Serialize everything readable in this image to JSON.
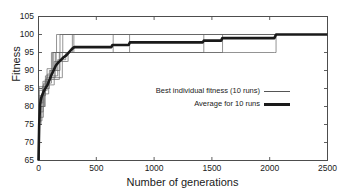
{
  "chart_data": {
    "type": "line",
    "title": "",
    "xlabel": "Number of generations",
    "ylabel": "Fitness",
    "xlim": [
      0,
      2500
    ],
    "ylim": [
      65,
      105
    ],
    "xticks": [
      0,
      500,
      1000,
      1500,
      2000,
      2500
    ],
    "yticks": [
      65,
      70,
      75,
      80,
      85,
      90,
      95,
      100,
      105
    ],
    "grid": false,
    "legend_position": "center-right",
    "legend": [
      "Best individual fitness (10 runs)",
      "Average for 10 runs"
    ],
    "series": [
      {
        "name": "Average for 10 runs",
        "style": "thick",
        "color": "#1a1a1a",
        "width": 2.6,
        "points": [
          [
            0,
            65.0
          ],
          [
            6,
            75.0
          ],
          [
            14,
            80.5
          ],
          [
            22,
            82.3
          ],
          [
            30,
            83.0
          ],
          [
            46,
            84.3
          ],
          [
            62,
            85.2
          ],
          [
            78,
            86.0
          ],
          [
            95,
            87.4
          ],
          [
            110,
            88.6
          ],
          [
            130,
            90.0
          ],
          [
            150,
            91.4
          ],
          [
            170,
            92.2
          ],
          [
            190,
            92.8
          ],
          [
            215,
            93.6
          ],
          [
            240,
            94.2
          ],
          [
            265,
            95.1
          ],
          [
            290,
            96.0
          ],
          [
            310,
            96.5
          ],
          [
            330,
            96.5
          ],
          [
            500,
            96.5
          ],
          [
            630,
            96.5
          ],
          [
            640,
            97.1
          ],
          [
            780,
            97.1
          ],
          [
            790,
            97.8
          ],
          [
            1000,
            97.8
          ],
          [
            1420,
            97.8
          ],
          [
            1430,
            98.3
          ],
          [
            1580,
            98.3
          ],
          [
            1590,
            99.0
          ],
          [
            2040,
            99.0
          ],
          [
            2055,
            100.0
          ],
          [
            2500,
            100.0
          ]
        ]
      },
      {
        "name": "Best individual fitness (10 runs) - run 1",
        "style": "thin",
        "color": "#666666",
        "width": 0.7,
        "points": [
          [
            0,
            65.0
          ],
          [
            4,
            75.0
          ],
          [
            20,
            75.0
          ],
          [
            22,
            80.0
          ],
          [
            55,
            80.0
          ],
          [
            58,
            87.5
          ],
          [
            100,
            87.5
          ],
          [
            103,
            90.0
          ],
          [
            150,
            90.0
          ],
          [
            153,
            95.0
          ],
          [
            290,
            95.0
          ],
          [
            293,
            100.0
          ],
          [
            2500,
            100.0
          ]
        ]
      },
      {
        "name": "Best individual fitness (10 runs) - run 2",
        "style": "thin",
        "color": "#666666",
        "width": 0.7,
        "points": [
          [
            0,
            65.0
          ],
          [
            5,
            77.0
          ],
          [
            38,
            77.0
          ],
          [
            42,
            84.5
          ],
          [
            72,
            84.5
          ],
          [
            75,
            89.0
          ],
          [
            120,
            89.0
          ],
          [
            124,
            95.0
          ],
          [
            205,
            95.0
          ],
          [
            210,
            100.0
          ],
          [
            2500,
            100.0
          ]
        ]
      },
      {
        "name": "Best individual fitness (10 runs) - run 3",
        "style": "thin",
        "color": "#666666",
        "width": 0.7,
        "points": [
          [
            0,
            65.0
          ],
          [
            5,
            82.0
          ],
          [
            30,
            82.0
          ],
          [
            34,
            85.5
          ],
          [
            64,
            85.5
          ],
          [
            68,
            88.0
          ],
          [
            140,
            88.0
          ],
          [
            145,
            95.0
          ],
          [
            640,
            95.0
          ],
          [
            646,
            100.0
          ],
          [
            2500,
            100.0
          ]
        ]
      },
      {
        "name": "Best individual fitness (10 runs) - run 4",
        "style": "thin",
        "color": "#666666",
        "width": 0.7,
        "points": [
          [
            0,
            65.0
          ],
          [
            6,
            80.0
          ],
          [
            48,
            80.0
          ],
          [
            52,
            85.0
          ],
          [
            90,
            85.0
          ],
          [
            94,
            90.0
          ],
          [
            180,
            90.0
          ],
          [
            186,
            95.0
          ],
          [
            780,
            95.0
          ],
          [
            788,
            100.0
          ],
          [
            2500,
            100.0
          ]
        ]
      },
      {
        "name": "Best individual fitness (10 runs) - run 5",
        "style": "thin",
        "color": "#666666",
        "width": 0.7,
        "points": [
          [
            0,
            65.0
          ],
          [
            6,
            76.0
          ],
          [
            26,
            76.0
          ],
          [
            30,
            83.5
          ],
          [
            84,
            83.5
          ],
          [
            88,
            87.5
          ],
          [
            175,
            87.5
          ],
          [
            180,
            95.0
          ],
          [
            1420,
            95.0
          ],
          [
            1430,
            100.0
          ],
          [
            2500,
            100.0
          ]
        ]
      },
      {
        "name": "Best individual fitness (10 runs) - run 6",
        "style": "thin",
        "color": "#666666",
        "width": 0.7,
        "points": [
          [
            0,
            65.0
          ],
          [
            5,
            84.5
          ],
          [
            42,
            84.5
          ],
          [
            46,
            86.5
          ],
          [
            108,
            86.5
          ],
          [
            112,
            95.0
          ],
          [
            150,
            95.0
          ],
          [
            156,
            100.0
          ],
          [
            2500,
            100.0
          ]
        ]
      },
      {
        "name": "Best individual fitness (10 runs) - run 7",
        "style": "thin",
        "color": "#666666",
        "width": 0.7,
        "points": [
          [
            0,
            65.0
          ],
          [
            7,
            78.5
          ],
          [
            36,
            78.5
          ],
          [
            40,
            86.0
          ],
          [
            130,
            86.0
          ],
          [
            136,
            92.5
          ],
          [
            250,
            92.5
          ],
          [
            256,
            95.0
          ],
          [
            1580,
            95.0
          ],
          [
            1592,
            100.0
          ],
          [
            2500,
            100.0
          ]
        ]
      },
      {
        "name": "Best individual fitness (10 runs) - run 8",
        "style": "thin",
        "color": "#666666",
        "width": 0.7,
        "points": [
          [
            0,
            65.0
          ],
          [
            6,
            83.0
          ],
          [
            56,
            83.0
          ],
          [
            60,
            88.5
          ],
          [
            160,
            88.5
          ],
          [
            166,
            93.0
          ],
          [
            230,
            93.0
          ],
          [
            236,
            95.0
          ],
          [
            2040,
            95.0
          ],
          [
            2055,
            100.0
          ],
          [
            2500,
            100.0
          ]
        ]
      },
      {
        "name": "Best individual fitness (10 runs) - run 9",
        "style": "thin",
        "color": "#666666",
        "width": 0.7,
        "points": [
          [
            0,
            65.0
          ],
          [
            5,
            85.5
          ],
          [
            70,
            85.5
          ],
          [
            74,
            90.5
          ],
          [
            120,
            90.5
          ],
          [
            126,
            95.0
          ],
          [
            180,
            95.0
          ],
          [
            186,
            100.0
          ],
          [
            2500,
            100.0
          ]
        ]
      },
      {
        "name": "Best individual fitness (10 runs) - run 10",
        "style": "thin",
        "color": "#666666",
        "width": 0.7,
        "points": [
          [
            0,
            65.0
          ],
          [
            6,
            81.0
          ],
          [
            34,
            81.0
          ],
          [
            38,
            87.0
          ],
          [
            96,
            87.0
          ],
          [
            100,
            88.0
          ],
          [
            200,
            88.0
          ],
          [
            206,
            95.0
          ],
          [
            300,
            95.0
          ],
          [
            306,
            100.0
          ],
          [
            2500,
            100.0
          ]
        ]
      }
    ]
  },
  "axes": {
    "frame_color": "#4d4d4d"
  }
}
